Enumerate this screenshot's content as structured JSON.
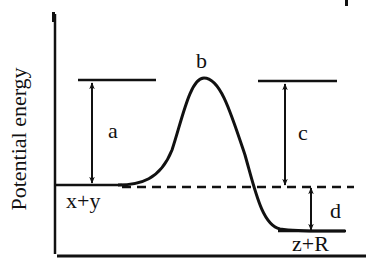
{
  "diagram": {
    "y_axis_label": "Potential energy",
    "x_axis_label": "",
    "labels": {
      "a": "a",
      "b": "b",
      "c": "c",
      "d": "d",
      "reactants": "x+y",
      "products": "z+R"
    },
    "levels": {
      "reactant_energy": "x+y",
      "transition_state": "b",
      "product_energy": "z+R"
    },
    "arrows": [
      {
        "name": "a",
        "from": "reactant level",
        "to": "transition state level",
        "meaning": "activation energy (forward)"
      },
      {
        "name": "c",
        "from": "transition state level",
        "to": "reactant level (dashed)",
        "meaning": "energy gap shown at right"
      },
      {
        "name": "d",
        "from": "reactant level (dashed)",
        "to": "product level",
        "meaning": "energy difference between reactants and products"
      }
    ],
    "colors": {
      "line": "#111111",
      "background": "#ffffff"
    }
  }
}
